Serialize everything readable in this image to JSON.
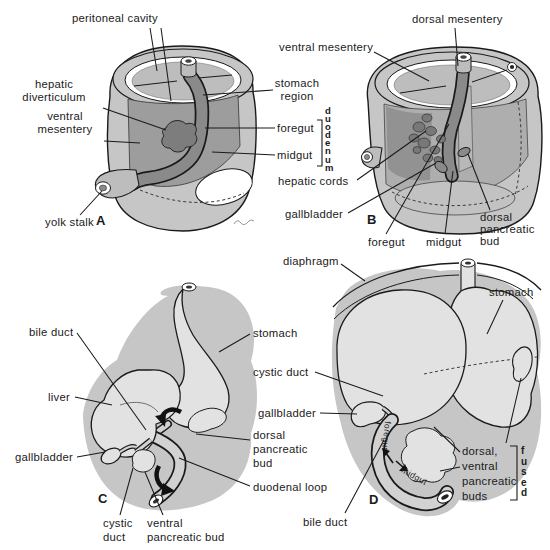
{
  "panel_letters": {
    "a": "A",
    "b": "B",
    "c": "C",
    "d": "D"
  },
  "labels": {
    "peritoneal_cavity": "peritoneal cavity",
    "dorsal_mesentery": "dorsal mesentery",
    "ventral_mesentery_b": "ventral mesentery",
    "stomach_region": "stomach\nregion",
    "hepatic_diverticulum": "hepatic\ndiverticulum",
    "ventral_mesentery_a": "ventral\nmesentery",
    "foregut_a": "foregut",
    "midgut_a": "midgut",
    "duodenum_vertical": "duodenum",
    "hepatic_cords": "hepatic cords",
    "gallbladder_b": "gallbladder",
    "foregut_b": "foregut",
    "midgut_b": "midgut",
    "dorsal_pancreatic_bud_b": "dorsal\npancreatic\nbud",
    "yolk_stalk": "yolk stalk",
    "diaphragm": "diaphragm",
    "stomach_d": "stomach",
    "stomach_c": "stomach",
    "cystic_duct_d": "cystic duct",
    "gallbladder_d": "gallbladder",
    "dorsal_pancreatic_bud_c": "dorsal\npancreatic\nbud",
    "duodenal_loop": "duodenal loop",
    "bile_duct_c": "bile duct",
    "liver_c": "liver",
    "gallbladder_c": "gallbladder",
    "cystic_duct_c": "cystic\nduct",
    "ventral_pancreatic_bud_c": "ventral\npancreatic bud",
    "dorsal_ventral_pancreatic_buds_d": "dorsal,\nventral\npancreatic\nbuds",
    "fused_vertical": "fused",
    "bile_duct_d": "bile duct",
    "foregut_d": "foregut",
    "midgut_d": "midgut"
  },
  "colors": {
    "paper": "#ffffff",
    "ink": "#1a1a1a",
    "body_gray": "#c6c6c6",
    "inner_gray": "#bdbdbd",
    "mesentery_gray": "#9d9d9d",
    "tube_gray": "#8a8a8a",
    "organ_gray": "#e2e2e2",
    "dark_gray": "#7d7d7d"
  }
}
